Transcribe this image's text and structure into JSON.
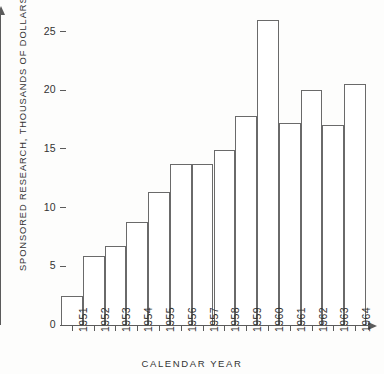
{
  "chart_data": {
    "type": "bar",
    "title": "",
    "xlabel": "CALENDAR YEAR",
    "ylabel": "SPONSORED RESEARCH, THOUSANDS OF DOLLARS",
    "categories": [
      "1951",
      "1952",
      "1953",
      "1954",
      "1955",
      "1956",
      "1957",
      "1958",
      "1959",
      "1960",
      "1961",
      "1962",
      "1963",
      "1964"
    ],
    "values": [
      2.5,
      5.9,
      6.7,
      8.8,
      11.3,
      13.7,
      13.7,
      14.9,
      17.8,
      26.0,
      17.2,
      20.0,
      17.0,
      20.5
    ],
    "ylim": [
      0,
      26.5
    ],
    "yticks": [
      0,
      5,
      10,
      15,
      20,
      25
    ],
    "ytick_labels": [
      "0",
      "5",
      "10",
      "15",
      "20",
      "25"
    ],
    "grid": false,
    "legend": null,
    "bar_style": "outline",
    "bar_fill": "#ffffff",
    "bar_stroke": "#6a6a6a",
    "axis_color": "#5b5b5b",
    "text_color": "#333333",
    "background": "#fdfdfc"
  }
}
